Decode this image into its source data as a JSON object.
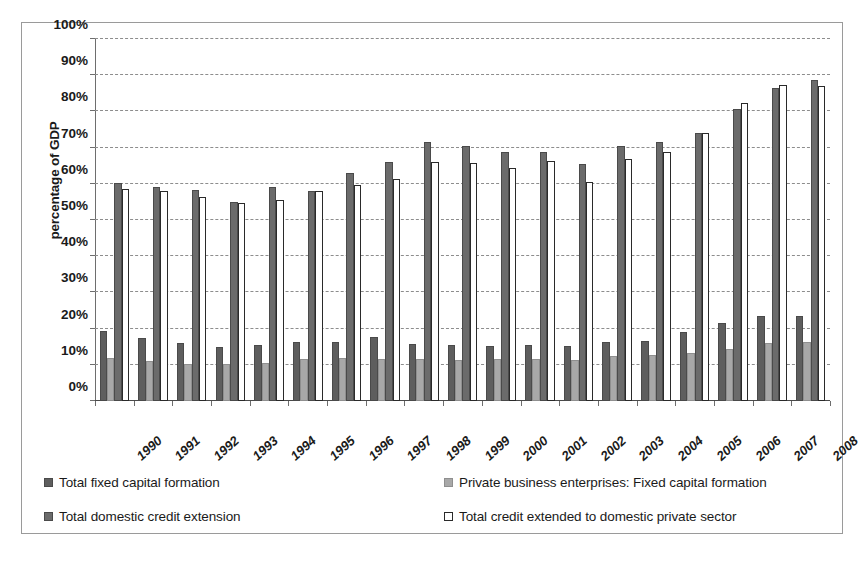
{
  "chart_data": {
    "type": "bar",
    "title": "",
    "xlabel": "",
    "ylabel": "percentage of GDP",
    "ylim": [
      0,
      100
    ],
    "ytick_labels": [
      "0%",
      "10%",
      "20%",
      "30%",
      "40%",
      "50%",
      "60%",
      "70%",
      "80%",
      "90%",
      "100%"
    ],
    "ytick_values": [
      0,
      10,
      20,
      30,
      40,
      50,
      60,
      70,
      80,
      90,
      100
    ],
    "grid": true,
    "legend_position": "bottom",
    "categories": [
      "1990",
      "1991",
      "1992",
      "1993",
      "1994",
      "1995",
      "1996",
      "1997",
      "1998",
      "1999",
      "2000",
      "2001",
      "2002",
      "2003",
      "2004",
      "2005",
      "2006",
      "2007",
      "2008"
    ],
    "series": [
      {
        "name": "Total fixed capital formation",
        "color": "#5e5e5e",
        "values": [
          19.3,
          17.3,
          16.0,
          14.8,
          15.5,
          16.2,
          16.4,
          17.6,
          15.8,
          15.6,
          15.2,
          15.4,
          15.3,
          16.2,
          16.6,
          19.0,
          21.6,
          23.4,
          23.4
        ]
      },
      {
        "name": "Private business enterprises: Fixed capital formation",
        "color": "#a8a8a8",
        "values": [
          11.9,
          11.0,
          10.3,
          10.2,
          10.6,
          11.6,
          11.8,
          11.6,
          11.5,
          11.4,
          11.6,
          11.5,
          11.4,
          12.3,
          12.6,
          13.2,
          14.4,
          15.9,
          16.2
        ]
      },
      {
        "name": "Total domestic credit extension",
        "color": "#6b6b6b",
        "values": [
          60.3,
          59.0,
          58.4,
          55.0,
          59.0,
          58.0,
          63.0,
          66.0,
          71.5,
          70.5,
          68.9,
          68.7,
          65.5,
          70.5,
          71.5,
          74.0,
          80.7,
          86.5,
          88.6
        ]
      },
      {
        "name": "Total credit extended to domestic private sector",
        "color": "#ffffff",
        "values": [
          58.5,
          58.0,
          56.3,
          54.6,
          55.4,
          58.0,
          59.8,
          61.3,
          66.0,
          65.7,
          64.3,
          66.4,
          60.4,
          66.8,
          68.8,
          74.0,
          82.3,
          87.2,
          86.9
        ]
      }
    ]
  },
  "legend": {
    "items": [
      {
        "label": "Total fixed capital formation",
        "swatch": "s1"
      },
      {
        "label": "Private business enterprises: Fixed capital formation",
        "swatch": "s2"
      },
      {
        "label": "Total domestic credit extension",
        "swatch": "s3"
      },
      {
        "label": "Total credit extended to domestic private sector",
        "swatch": "s4"
      }
    ]
  }
}
